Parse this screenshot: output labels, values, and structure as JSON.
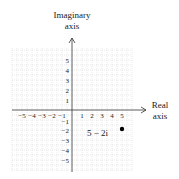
{
  "diagram": {
    "y_axis_label_line1": "Imaginary",
    "y_axis_label_line2": "axis",
    "x_axis_label_line1": "Real",
    "x_axis_label_line2": "axis",
    "x_ticks": [
      "−5",
      "−4",
      "−3",
      "−2",
      "−1",
      "1",
      "2",
      "3",
      "4",
      "5"
    ],
    "y_ticks": [
      "5",
      "4",
      "3",
      "2",
      "1",
      "−1",
      "−2",
      "−3",
      "−4",
      "−5"
    ],
    "point_label": "5 − 2i",
    "point": {
      "re": 5,
      "im": -2
    },
    "colors": {
      "grid": "#c8c8c8",
      "axis": "#333333",
      "text": "#222222",
      "point": "#000000"
    }
  }
}
